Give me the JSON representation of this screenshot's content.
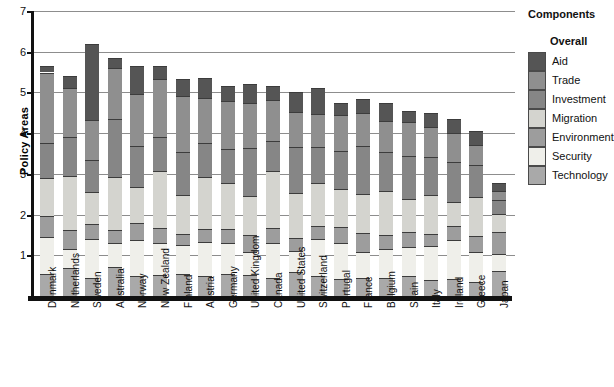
{
  "chart_data": {
    "type": "bar",
    "stacked": true,
    "title": "",
    "xlabel": "",
    "ylabel": "Policy Areas",
    "ylim": [
      0,
      7
    ],
    "yticks": [
      1,
      2,
      3,
      4,
      5,
      6,
      7
    ],
    "grid": true,
    "legend_position": "right",
    "legend_title": "Components",
    "legend_subtitle": "Overall",
    "categories": [
      "Denmark",
      "Netherlands",
      "Sweden",
      "Australia",
      "Norway",
      "New Zealand",
      "Finland",
      "Austria",
      "Germany",
      "United Kingdom",
      "Canada",
      "United States",
      "Switzerland",
      "Portugal",
      "France",
      "Belgium",
      "Spain",
      "Italy",
      "Ireland",
      "Greece",
      "Japan"
    ],
    "series": [
      {
        "name": "Technology",
        "color": "#a9a9a9",
        "values": [
          0.55,
          0.7,
          0.45,
          0.72,
          0.48,
          0.52,
          0.55,
          0.5,
          0.55,
          0.52,
          0.45,
          0.58,
          0.5,
          0.42,
          0.45,
          0.45,
          0.48,
          0.4,
          0.42,
          0.35,
          0.62
        ]
      },
      {
        "name": "Security",
        "color": "#efefea",
        "values": [
          0.9,
          0.45,
          0.95,
          0.58,
          0.9,
          0.78,
          0.7,
          0.82,
          0.75,
          0.55,
          0.85,
          0.52,
          0.9,
          0.88,
          0.62,
          0.7,
          0.72,
          0.82,
          0.95,
          0.72,
          0.4
        ]
      },
      {
        "name": "Environment",
        "color": "#9d9d9d",
        "values": [
          0.52,
          0.48,
          0.38,
          0.32,
          0.42,
          0.36,
          0.28,
          0.32,
          0.35,
          0.43,
          0.38,
          0.32,
          0.32,
          0.4,
          0.48,
          0.35,
          0.38,
          0.3,
          0.35,
          0.4,
          0.55
        ]
      },
      {
        "name": "Migration",
        "color": "#d4d4cf",
        "values": [
          0.92,
          1.32,
          0.78,
          1.3,
          0.88,
          1.4,
          0.95,
          1.28,
          1.12,
          0.95,
          1.38,
          1.1,
          1.05,
          0.92,
          0.95,
          1.08,
          0.8,
          0.95,
          0.6,
          0.95,
          0.45
        ]
      },
      {
        "name": "Investment",
        "color": "#868686",
        "values": [
          0.88,
          0.95,
          0.78,
          1.42,
          1.0,
          0.85,
          1.05,
          0.85,
          0.85,
          1.18,
          0.75,
          1.15,
          0.88,
          0.95,
          1.18,
          0.95,
          1.05,
          0.95,
          0.98,
          0.8,
          0.35
        ]
      },
      {
        "name": "Trade",
        "color": "#8f8f8f",
        "values": [
          1.72,
          1.22,
          0.98,
          1.25,
          1.28,
          1.42,
          1.38,
          1.1,
          1.18,
          1.12,
          1.0,
          0.85,
          0.82,
          0.88,
          0.82,
          0.78,
          0.85,
          0.72,
          0.7,
          0.48,
          0.2
        ]
      },
      {
        "name": "Aid",
        "color": "#555555",
        "values": [
          0.16,
          0.28,
          1.88,
          0.26,
          0.68,
          0.32,
          0.42,
          0.48,
          0.35,
          0.45,
          0.35,
          0.48,
          0.65,
          0.3,
          0.35,
          0.42,
          0.27,
          0.35,
          0.35,
          0.35,
          0.2
        ]
      }
    ]
  },
  "axis": {
    "y_title": "Policy Areas",
    "y_tick_labels": [
      "1",
      "2",
      "3",
      "4",
      "5",
      "6",
      "7"
    ]
  },
  "legend": {
    "title": "Components",
    "subtitle": "Overall",
    "items": [
      {
        "label": "Aid",
        "color": "#555555"
      },
      {
        "label": "Trade",
        "color": "#8f8f8f"
      },
      {
        "label": "Investment",
        "color": "#868686"
      },
      {
        "label": "Migration",
        "color": "#d4d4cf"
      },
      {
        "label": "Environment",
        "color": "#9d9d9d"
      },
      {
        "label": "Security",
        "color": "#efefea"
      },
      {
        "label": "Technology",
        "color": "#a9a9a9"
      }
    ]
  }
}
